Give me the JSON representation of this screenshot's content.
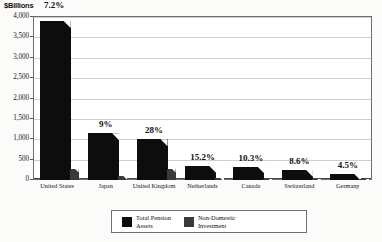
{
  "chart_data": {
    "type": "bar",
    "title": "",
    "ylabel": "$Billions",
    "xlabel": "",
    "ylim": [
      0,
      4000
    ],
    "yticks": [
      "0",
      "500",
      "1,000",
      "1,500",
      "2,000",
      "2,500",
      "3,000",
      "3,500",
      "4,000"
    ],
    "ytick_values": [
      0,
      500,
      1000,
      1500,
      2000,
      2500,
      3000,
      3500,
      4000
    ],
    "grid": true,
    "legend_position": "bottom",
    "categories": [
      "United States",
      "Japan",
      "United Kingdom",
      "Netherlands",
      "Canada",
      "Switzerland",
      "Germany"
    ],
    "annotations": [
      "7.2%",
      "9%",
      "28%",
      "15.2%",
      "10.3%",
      "8.6%",
      "4.5%"
    ],
    "series": [
      {
        "name": "Total Pension Assets",
        "color": "#0d0d0d",
        "values": [
          3900,
          1150,
          1000,
          350,
          330,
          250,
          150
        ]
      },
      {
        "name": "Non-Domestic Investment",
        "color": "#3a3a3a",
        "values": [
          281,
          104,
          280,
          53,
          34,
          22,
          7
        ]
      }
    ]
  },
  "legend": {
    "entries": [
      {
        "label": "Total Pension\nAssets",
        "swatch": "black-swatch"
      },
      {
        "label": "Non-Domestic\nInvestment",
        "swatch": "gray-swatch"
      }
    ]
  }
}
